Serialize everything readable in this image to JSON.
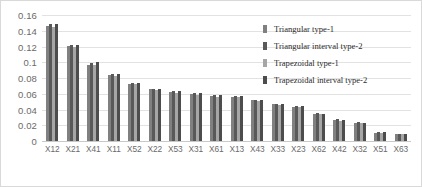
{
  "chart_data": {
    "type": "bar",
    "title": "",
    "xlabel": "",
    "ylabel": "",
    "ylim": [
      0,
      0.16
    ],
    "ytick_labels": [
      "0.16",
      "0.14",
      "0.12",
      "0.1",
      "0.08",
      "0.06",
      "0.04",
      "0.02",
      "0"
    ],
    "ytick_values": [
      0.16,
      0.14,
      0.12,
      0.1,
      0.08,
      0.06,
      0.04,
      0.02,
      0
    ],
    "grid": true,
    "legend_position": "upper-right-inside",
    "categories": [
      "X12",
      "X21",
      "X41",
      "X11",
      "X52",
      "X22",
      "X53",
      "X31",
      "X61",
      "X13",
      "X43",
      "X33",
      "X23",
      "X62",
      "X42",
      "X32",
      "X51",
      "X63"
    ],
    "series": [
      {
        "name": "Triangular type-1",
        "color": "#808080",
        "values": [
          0.1455,
          0.1205,
          0.097,
          0.0835,
          0.0725,
          0.0655,
          0.0625,
          0.0595,
          0.0575,
          0.056,
          0.0515,
          0.0465,
          0.0435,
          0.0345,
          0.0265,
          0.0235,
          0.0105,
          0.0095
        ]
      },
      {
        "name": "Triangular interval type-2",
        "color": "#595959",
        "values": [
          0.1485,
          0.1215,
          0.0995,
          0.085,
          0.0735,
          0.0665,
          0.0635,
          0.0605,
          0.0585,
          0.0575,
          0.0525,
          0.0475,
          0.0445,
          0.035,
          0.0275,
          0.024,
          0.011,
          0.0095
        ]
      },
      {
        "name": "Trapezoidal type-1",
        "color": "#a6a6a6",
        "values": [
          0.1445,
          0.1195,
          0.0965,
          0.083,
          0.072,
          0.065,
          0.0615,
          0.059,
          0.0565,
          0.0555,
          0.051,
          0.046,
          0.043,
          0.034,
          0.026,
          0.023,
          0.0105,
          0.009
        ]
      },
      {
        "name": "Trapezoidal interval type-2",
        "color": "#4d4d4d",
        "values": [
          0.1485,
          0.1215,
          0.1005,
          0.0845,
          0.0735,
          0.066,
          0.063,
          0.0605,
          0.058,
          0.057,
          0.052,
          0.047,
          0.044,
          0.0345,
          0.027,
          0.0235,
          0.011,
          0.0095
        ]
      }
    ]
  }
}
